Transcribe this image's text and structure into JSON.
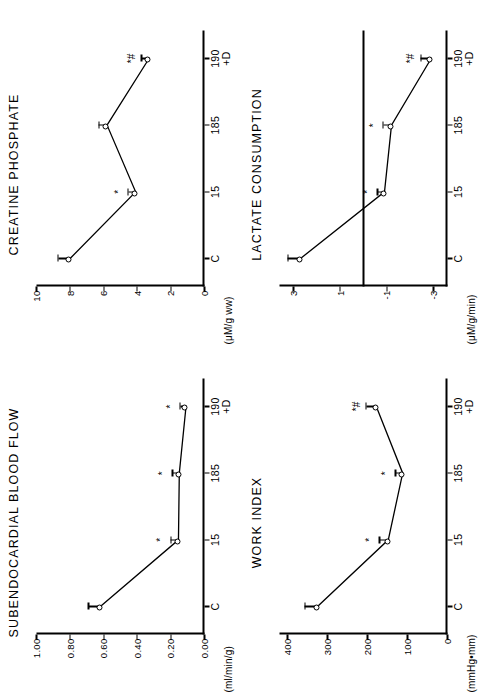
{
  "figure": {
    "orientation": "rotated-90-ccw",
    "panel_count": 4,
    "xaxis_categories": [
      "C",
      "15",
      "185",
      "190\n+D"
    ],
    "significance_symbols": {
      "star": "*",
      "hash": "#",
      "star_hash": "*#"
    }
  },
  "panels": {
    "creatine_phosphate": {
      "title": "CREATINE PHOSPHATE",
      "ylabel": "(μM/g ww)",
      "yticks": [
        "0",
        "2",
        "4",
        "6",
        "8",
        "10"
      ],
      "xticks": [
        "C",
        "15",
        "185",
        "190",
        "+D"
      ]
    },
    "subendocardial_blood_flow": {
      "title": "SUBENDOCARDIAL BLOOD FLOW",
      "ylabel": "(ml/min/g)",
      "yticks": [
        "0.00",
        "0.20",
        "0.40",
        "0.60",
        "0.80",
        "1.00"
      ],
      "xticks": [
        "C",
        "15",
        "185",
        "190",
        "+D"
      ]
    },
    "lactate_consumption": {
      "title": "LACTATE CONSUMPTION",
      "ylabel": "(μM/g/min)",
      "yticks": [
        "-3",
        "-1",
        "1",
        "3"
      ],
      "xticks": [
        "C",
        "15",
        "185",
        "190",
        "+D"
      ]
    },
    "work_index": {
      "title": "WORK INDEX",
      "ylabel": "(mmHg•mm)",
      "yticks": [
        "0",
        "100",
        "200",
        "300",
        "400"
      ],
      "xticks": [
        "C",
        "15",
        "185",
        "190",
        "+D"
      ]
    }
  },
  "chart_data": [
    {
      "type": "line",
      "title": "CREATINE PHOSPHATE",
      "xlabel": "",
      "ylabel": "(μM/g ww)",
      "categories": [
        "C",
        "15",
        "185",
        "190+D"
      ],
      "values": [
        8.0,
        4.1,
        5.8,
        3.3
      ],
      "errors": [
        0.7,
        0.45,
        0.5,
        0.45
      ],
      "annotations": [
        "",
        "*",
        "",
        "*#"
      ],
      "ylim": [
        0,
        10
      ],
      "yticks": [
        0,
        2,
        4,
        6,
        8,
        10
      ],
      "grid": false,
      "legend": "none"
    },
    {
      "type": "line",
      "title": "SUBENDOCARDIAL BLOOD FLOW",
      "xlabel": "",
      "ylabel": "(ml/min/g)",
      "categories": [
        "C",
        "15",
        "185",
        "190+D"
      ],
      "values": [
        0.62,
        0.155,
        0.15,
        0.11
      ],
      "errors": [
        0.07,
        0.045,
        0.04,
        0.035
      ],
      "annotations": [
        "",
        "*",
        "*",
        "*"
      ],
      "ylim": [
        0.0,
        1.0
      ],
      "yticks": [
        0.0,
        0.2,
        0.4,
        0.6,
        0.8,
        1.0
      ],
      "grid": false,
      "legend": "none"
    },
    {
      "type": "line",
      "title": "LACTATE CONSUMPTION",
      "xlabel": "",
      "ylabel": "(μM/g/min)",
      "categories": [
        "C",
        "15",
        "185",
        "190+D"
      ],
      "values": [
        2.7,
        -0.9,
        -1.2,
        -2.9
      ],
      "errors": [
        0.55,
        0.3,
        0.35,
        0.45
      ],
      "annotations": [
        "",
        "*",
        "*",
        "*#"
      ],
      "ylim": [
        -3.6,
        3.6
      ],
      "yticks": [
        -3,
        -1,
        1,
        3
      ],
      "zero_line": 0,
      "grid": false,
      "legend": "none"
    },
    {
      "type": "line",
      "title": "WORK INDEX",
      "xlabel": "",
      "ylabel": "(mmHg•mm)",
      "categories": [
        "C",
        "15",
        "185",
        "190+D"
      ],
      "values": [
        325,
        148,
        112,
        178
      ],
      "errors": [
        32,
        22,
        18,
        25
      ],
      "annotations": [
        "",
        "*",
        "*",
        "*#"
      ],
      "ylim": [
        0,
        420
      ],
      "yticks": [
        0,
        100,
        200,
        300,
        400
      ],
      "grid": false,
      "legend": "none"
    }
  ]
}
